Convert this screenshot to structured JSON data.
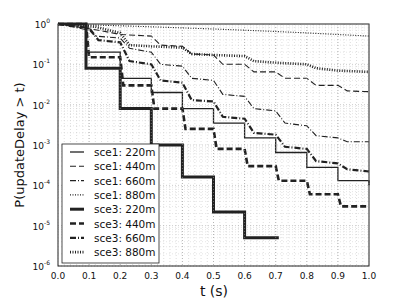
{
  "chart_data": {
    "type": "line",
    "title": "",
    "xlabel": "t (s)",
    "ylabel": "P(updateDelay > t)",
    "xlim": [
      0.0,
      1.0
    ],
    "ylim": [
      1e-06,
      1
    ],
    "yscale": "log",
    "grid": true,
    "legend_position": "lower left",
    "xticks": [
      "0.0",
      "0.1",
      "0.2",
      "0.3",
      "0.4",
      "0.5",
      "0.6",
      "0.7",
      "0.8",
      "0.9",
      "1.0"
    ],
    "yticks": [
      {
        "base": "10",
        "exp": "0"
      },
      {
        "base": "10",
        "exp": "-1"
      },
      {
        "base": "10",
        "exp": "-2"
      },
      {
        "base": "10",
        "exp": "-3"
      },
      {
        "base": "10",
        "exp": "-4"
      },
      {
        "base": "10",
        "exp": "-5"
      },
      {
        "base": "10",
        "exp": "-6"
      }
    ],
    "series": [
      {
        "name": "sce1: 220m",
        "style": "solid",
        "width": 1.3,
        "x": [
          0,
          0.09,
          0.09,
          0.2,
          0.2,
          0.3,
          0.3,
          0.4,
          0.4,
          0.5,
          0.5,
          0.6,
          0.6,
          0.7,
          0.7,
          0.8,
          0.8,
          0.9,
          0.9,
          1.0,
          1.0
        ],
        "y": [
          1,
          1,
          0.2,
          0.2,
          0.045,
          0.045,
          0.02,
          0.02,
          0.008,
          0.008,
          0.0035,
          0.0035,
          0.0015,
          0.0015,
          0.00065,
          0.00065,
          0.00028,
          0.00028,
          0.00013,
          0.00013,
          0.0001
        ]
      },
      {
        "name": "sce1: 440m",
        "style": "dash",
        "width": 1.1,
        "x": [
          0,
          0.13,
          0.2,
          0.3,
          0.33,
          0.4,
          0.43,
          0.5,
          0.53,
          0.6,
          0.63,
          0.7,
          0.73,
          0.8,
          0.83,
          0.9,
          0.93,
          1.0
        ],
        "y": [
          1,
          0.7,
          0.55,
          0.5,
          0.3,
          0.28,
          0.18,
          0.17,
          0.1,
          0.1,
          0.065,
          0.065,
          0.045,
          0.045,
          0.03,
          0.03,
          0.022,
          0.021
        ]
      },
      {
        "name": "sce1: 660m",
        "style": "dashdot",
        "width": 1.1,
        "x": [
          0,
          0.1,
          0.12,
          0.2,
          0.23,
          0.3,
          0.33,
          0.4,
          0.43,
          0.5,
          0.53,
          0.6,
          0.63,
          0.7,
          0.73,
          0.8,
          0.83,
          0.9,
          0.93,
          1.0
        ],
        "y": [
          1,
          0.7,
          0.5,
          0.45,
          0.25,
          0.2,
          0.1,
          0.09,
          0.045,
          0.04,
          0.018,
          0.016,
          0.008,
          0.007,
          0.0035,
          0.003,
          0.0017,
          0.0015,
          0.0012,
          0.0012
        ]
      },
      {
        "name": "sce1: 880m",
        "style": "dot",
        "width": 1.1,
        "x": [
          0,
          0.1,
          0.2,
          0.3,
          0.4,
          0.5,
          0.6,
          0.7,
          0.8,
          0.9,
          1.0
        ],
        "y": [
          1,
          0.95,
          0.9,
          0.85,
          0.8,
          0.75,
          0.7,
          0.65,
          0.6,
          0.55,
          0.5
        ]
      },
      {
        "name": "sce3: 220m",
        "style": "solid",
        "width": 3,
        "x": [
          0,
          0.09,
          0.09,
          0.2,
          0.2,
          0.3,
          0.3,
          0.4,
          0.4,
          0.5,
          0.5,
          0.6,
          0.6,
          0.71
        ],
        "y": [
          1,
          1,
          0.08,
          0.08,
          0.008,
          0.008,
          0.001,
          0.001,
          0.00016,
          0.00016,
          2.2e-05,
          2.2e-05,
          5e-06,
          5e-06
        ]
      },
      {
        "name": "sce3: 440m",
        "style": "dash",
        "width": 2.6,
        "x": [
          0,
          0.09,
          0.1,
          0.2,
          0.21,
          0.3,
          0.31,
          0.4,
          0.41,
          0.5,
          0.51,
          0.6,
          0.61,
          0.7,
          0.71,
          0.8,
          0.81,
          0.9,
          0.91,
          1.0
        ],
        "y": [
          1,
          1,
          0.15,
          0.15,
          0.03,
          0.03,
          0.008,
          0.008,
          0.0025,
          0.0025,
          0.0008,
          0.0008,
          0.0003,
          0.0003,
          0.00013,
          0.00013,
          6e-05,
          6e-05,
          3e-05,
          3e-05
        ]
      },
      {
        "name": "sce3: 660m",
        "style": "dashdot",
        "width": 2.2,
        "x": [
          0,
          0.1,
          0.13,
          0.2,
          0.23,
          0.3,
          0.33,
          0.4,
          0.43,
          0.5,
          0.53,
          0.6,
          0.63,
          0.7,
          0.73,
          0.8,
          0.83,
          0.9,
          0.93,
          1.0
        ],
        "y": [
          1,
          0.8,
          0.4,
          0.35,
          0.12,
          0.1,
          0.04,
          0.035,
          0.013,
          0.012,
          0.005,
          0.0045,
          0.002,
          0.0018,
          0.0009,
          0.0008,
          0.0004,
          0.00035,
          0.00025,
          0.00022
        ]
      },
      {
        "name": "sce3: 880m",
        "style": "dot",
        "width": 2.6,
        "x": [
          0,
          0.12,
          0.2,
          0.23,
          0.3,
          0.4,
          0.43,
          0.5,
          0.6,
          0.63,
          0.7,
          0.8,
          0.83,
          0.9,
          1.0
        ],
        "y": [
          1,
          0.85,
          0.6,
          0.3,
          0.28,
          0.26,
          0.18,
          0.17,
          0.16,
          0.12,
          0.11,
          0.1,
          0.08,
          0.07,
          0.065
        ]
      }
    ]
  }
}
